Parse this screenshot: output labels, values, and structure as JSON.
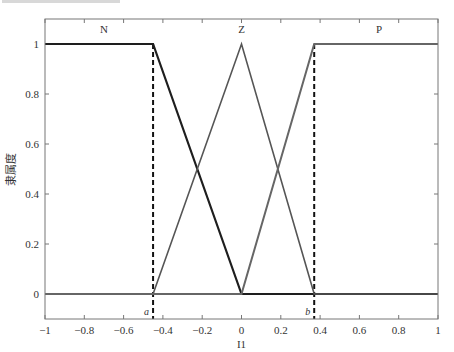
{
  "chart_data": {
    "type": "line",
    "title": "",
    "xlabel": "I1",
    "ylabel": "隶属度",
    "xlim": [
      -1,
      1
    ],
    "ylim": [
      -0.1,
      1.1
    ],
    "xticks": [
      -1,
      -0.8,
      -0.6,
      -0.4,
      -0.2,
      0,
      0.2,
      0.4,
      0.6,
      0.8,
      1
    ],
    "xtick_labels": [
      "−1",
      "−0.8",
      "−0.6",
      "−0.4",
      "−0.2",
      "0",
      "0.2",
      "0.4",
      "0.6",
      "0.8",
      "1"
    ],
    "yticks": [
      0,
      0.2,
      0.4,
      0.6,
      0.8,
      1
    ],
    "ytick_labels": [
      "0",
      "0.2",
      "0.4",
      "0.6",
      "0.8",
      "1"
    ],
    "grid": false,
    "series": [
      {
        "name": "N",
        "color": "#1e1e1e",
        "width": 2.2,
        "x": [
          -1,
          -0.45,
          0,
          1
        ],
        "y": [
          1,
          1,
          0,
          0
        ]
      },
      {
        "name": "Z",
        "color": "#555555",
        "width": 1.6,
        "x": [
          -1,
          -0.45,
          0,
          0.37,
          1
        ],
        "y": [
          0,
          0,
          1,
          0,
          0
        ]
      },
      {
        "name": "P",
        "color": "#666666",
        "width": 2.0,
        "x": [
          -1,
          0,
          0.37,
          1
        ],
        "y": [
          0,
          0,
          1,
          1
        ]
      }
    ],
    "annotations": [
      {
        "text": "N",
        "x": -0.7,
        "y": 1.06
      },
      {
        "text": "Z",
        "x": 0,
        "y": 1.06
      },
      {
        "text": "P",
        "x": 0.7,
        "y": 1.06
      },
      {
        "text": "a",
        "x": -0.45,
        "y": -0.1,
        "style": "dashed vertical line"
      },
      {
        "text": "b",
        "x": 0.37,
        "y": -0.1,
        "style": "dashed vertical line"
      }
    ],
    "vlines": [
      {
        "label": "a",
        "x": -0.45,
        "style": "dashed",
        "color": "#111111"
      },
      {
        "label": "b",
        "x": 0.37,
        "style": "dashed",
        "color": "#111111"
      }
    ]
  }
}
